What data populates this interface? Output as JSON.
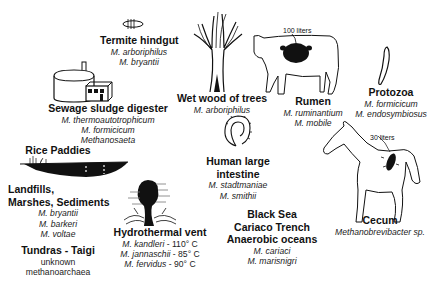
{
  "habitats": [
    {
      "id": "termite",
      "title": "Termite hindgut",
      "species": [
        "M. arboriphilus",
        "M. bryantii"
      ]
    },
    {
      "id": "sewage",
      "title": "Sewage sludge digester",
      "species": [
        "M. thermoautotrophicum",
        "M. formicicum",
        "Methanosaeta"
      ]
    },
    {
      "id": "wetwood",
      "title": "Wet wood of trees",
      "species": [
        "M. arboriphilus"
      ]
    },
    {
      "id": "rumen",
      "title": "Rumen",
      "species": [
        "M. ruminantium",
        "M. mobile"
      ],
      "volume": "100 liters"
    },
    {
      "id": "protozoa",
      "title": "Protozoa",
      "species": [
        "M. formicicum",
        "M. endosymbiosus"
      ]
    },
    {
      "id": "rice",
      "title": "Rice Paddies",
      "species": []
    },
    {
      "id": "landfills",
      "title_lines": [
        "Landfills,",
        "Marshes, Sediments"
      ],
      "species": [
        "M. bryantii",
        "M. barkeri",
        "M. voltae"
      ]
    },
    {
      "id": "human",
      "title_lines": [
        "Human large",
        "intestine"
      ],
      "species": [
        "M. stadtmaniae",
        "M. smithii"
      ]
    },
    {
      "id": "hydro",
      "title": "Hydrothermal vent",
      "species": [
        {
          "name": "M. kandleri",
          "temp": "- 110° C"
        },
        {
          "name": "M. jannaschii",
          "temp": "- 85° C"
        },
        {
          "name": "M. fervidus",
          "temp": "- 90° C"
        }
      ]
    },
    {
      "id": "blacksea",
      "title_lines": [
        "Black Sea",
        "Cariaco Trench",
        "Anaerobic oceans"
      ],
      "species": [
        "M. cariaci",
        "M. marisnigri"
      ]
    },
    {
      "id": "cecum",
      "title": "Cecum",
      "species": [
        "Methanobrevibacter sp."
      ],
      "volume": "30 liters"
    },
    {
      "id": "tundra",
      "title": "Tundras - Taigi",
      "notes": [
        "unknown",
        "methanoarchaea"
      ]
    }
  ],
  "colors": {
    "ink": "#111111",
    "background": "#ffffff"
  }
}
